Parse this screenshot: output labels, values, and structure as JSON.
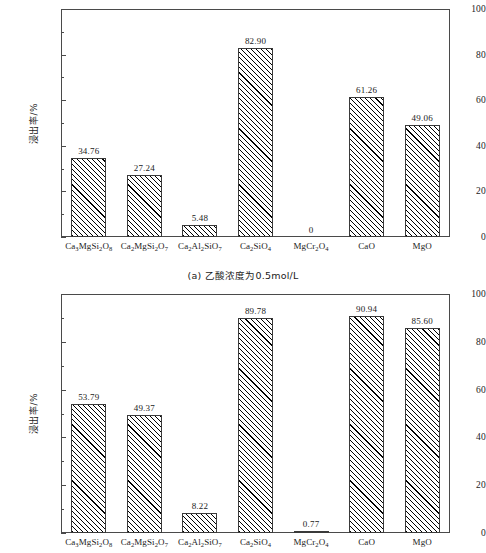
{
  "figure": {
    "background": "#ffffff",
    "axis_color": "#4a4a4a",
    "bar_edge_color": "#3a3a3a",
    "hatch": "forward-diagonal"
  },
  "panel_a": {
    "caption": "(a) 乙酸浓度为0.5mol/L"
  },
  "panel_b": {
    "caption": ""
  },
  "chart_data": [
    {
      "type": "bar",
      "panel": "a",
      "title": "(a) 乙酸浓度为0.5mol/L",
      "xlabel": "",
      "ylabel": "浸出率/%",
      "ylim": [
        0,
        100
      ],
      "yticks": [
        0,
        20,
        40,
        60,
        80,
        100
      ],
      "ytick_labels": [
        "0",
        "20",
        "40",
        "60",
        "80",
        "100"
      ],
      "minor_tick_step": 10,
      "grid": false,
      "legend": "none",
      "categories": [
        "Ca3MgSi2O8",
        "Ca2MgSi2O7",
        "Ca2Al2SiO7",
        "Ca2SiO4",
        "MgCr2O4",
        "CaO",
        "MgO"
      ],
      "categories_html": [
        "Ca<sub>3</sub>MgSi<sub>2</sub>O<sub>8</sub>",
        "Ca<sub>2</sub>MgSi<sub>2</sub>O<sub>7</sub>",
        "Ca<sub>2</sub>Al<sub>2</sub>SiO<sub>7</sub>",
        "Ca<sub>2</sub>SiO<sub>4</sub>",
        "MgCr<sub>2</sub>O<sub>4</sub>",
        "CaO",
        "MgO"
      ],
      "values": [
        34.76,
        27.24,
        5.48,
        82.9,
        0,
        61.26,
        49.06
      ],
      "value_labels": [
        "34.76",
        "27.24",
        "5.48",
        "82.90",
        "0",
        "61.26",
        "49.06"
      ]
    },
    {
      "type": "bar",
      "panel": "b",
      "title": "",
      "xlabel": "",
      "ylabel": "浸出率/%",
      "ylim": [
        0,
        100
      ],
      "yticks": [
        0,
        20,
        40,
        60,
        80,
        100
      ],
      "ytick_labels": [
        "0",
        "20",
        "40",
        "60",
        "80",
        "100"
      ],
      "minor_tick_step": 10,
      "grid": false,
      "legend": "none",
      "categories": [
        "Ca3MgSi2O8",
        "Ca2MgSi2O7",
        "Ca2Al2SiO7",
        "Ca2SiO4",
        "MgCr2O4",
        "CaO",
        "MgO"
      ],
      "categories_html": [
        "Ca<sub>3</sub>MgSi<sub>2</sub>O<sub>8</sub>",
        "Ca<sub>2</sub>MgSi<sub>2</sub>O<sub>7</sub>",
        "Ca<sub>2</sub>Al<sub>2</sub>SiO<sub>7</sub>",
        "Ca<sub>2</sub>SiO<sub>4</sub>",
        "MgCr<sub>2</sub>O<sub>4</sub>",
        "CaO",
        "MgO"
      ],
      "values": [
        53.79,
        49.37,
        8.22,
        89.78,
        0.77,
        90.94,
        85.6
      ],
      "value_labels": [
        "53.79",
        "49.37",
        "8.22",
        "89.78",
        "0.77",
        "90.94",
        "85.60"
      ]
    }
  ]
}
